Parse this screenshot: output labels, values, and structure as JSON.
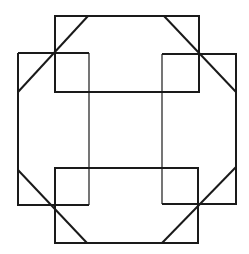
{
  "figure": {
    "line_color": "#1a1a1a",
    "background_color": "#ffffff",
    "shapes": [
      {
        "name": "top-rectangle",
        "type": "rectangle",
        "orientation": "horizontal"
      },
      {
        "name": "bottom-rectangle",
        "type": "rectangle",
        "orientation": "horizontal"
      },
      {
        "name": "left-rectangle",
        "type": "rectangle",
        "orientation": "vertical"
      },
      {
        "name": "right-rectangle",
        "type": "rectangle",
        "orientation": "vertical"
      },
      {
        "name": "diagonal-top-left",
        "type": "line"
      },
      {
        "name": "diagonal-top-right",
        "type": "line"
      },
      {
        "name": "diagonal-bottom-left",
        "type": "line"
      },
      {
        "name": "diagonal-bottom-right",
        "type": "line"
      }
    ]
  }
}
